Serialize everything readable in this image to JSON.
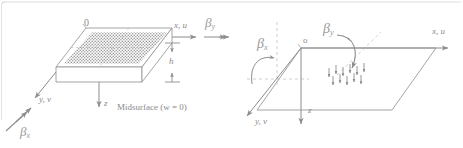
{
  "figure": {
    "name": "plate-element-coordinate-diagram",
    "background": "#ffffff",
    "border_color": "#d8d8d8",
    "ink_color": "#8a8a8a",
    "stipple_color": "#9b9b9b",
    "width": 463,
    "height": 148
  },
  "left_panel": {
    "name": "plate-solid-view",
    "origin_label": "0",
    "axis_x_label": "x, u",
    "axis_y_label": "y, v",
    "axis_z_label": "z",
    "thickness_label": "h",
    "midsurface_label": "Midsurface (w = 0)",
    "rotation_y": {
      "symbol": "β",
      "subscript": "y"
    },
    "rotation_x": {
      "symbol": "β",
      "subscript": "x"
    }
  },
  "right_panel": {
    "name": "plate-midplane-view",
    "origin_label": "o",
    "axis_x_label": "x, u",
    "axis_y_label": "y, v",
    "axis_z_label": "z",
    "rotation_x": {
      "symbol": "β",
      "subscript": "x"
    },
    "rotation_y": {
      "symbol": "β",
      "subscript": "y"
    },
    "load_arrow_count": 11
  }
}
